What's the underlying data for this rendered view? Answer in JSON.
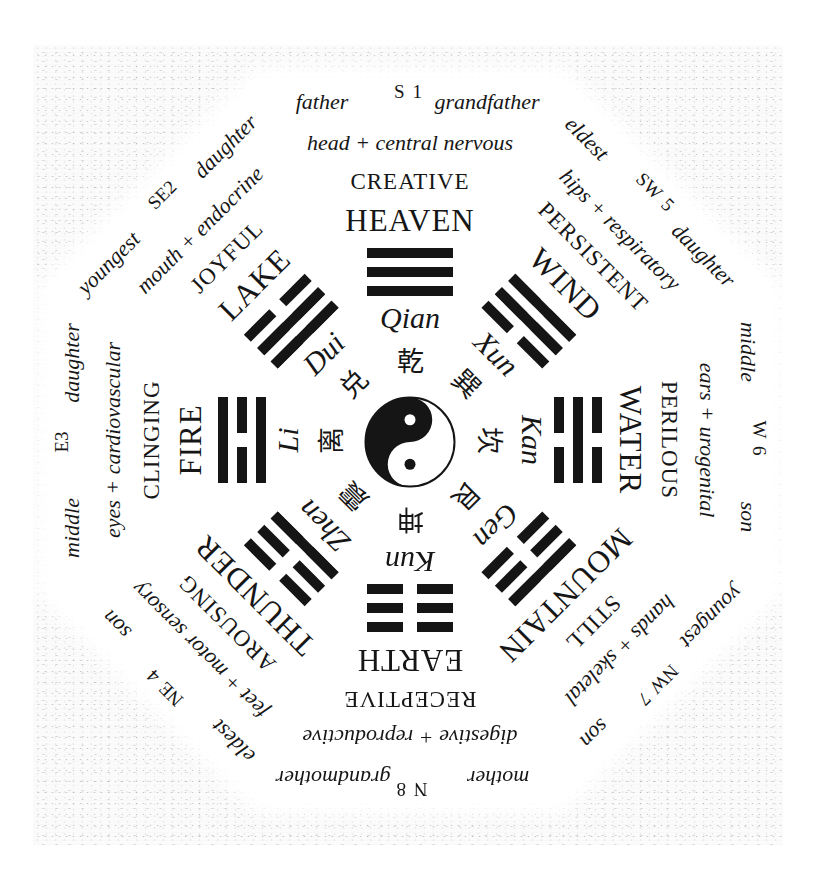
{
  "diagram": {
    "center": {
      "symbol": "yin-yang"
    },
    "colors": {
      "ink": "#161616",
      "paper": "#fbfbfb",
      "octagon": "#ffffff"
    },
    "sectors": [
      {
        "direction": "S 1",
        "relation_left": "father",
        "relation_right": "grandfather",
        "body": "head + central nervous",
        "quality": "CREATIVE",
        "element": "HEAVEN",
        "trigram": [
          1,
          1,
          1
        ],
        "name": "Qian",
        "char": "乾"
      },
      {
        "direction": "SW 5",
        "relation_left": "eldest",
        "relation_right": "daughter",
        "body": "hips + respiratory",
        "quality": "PERSISTENT",
        "element": "WIND",
        "trigram": [
          1,
          1,
          0
        ],
        "name": "Xun",
        "char": "巽"
      },
      {
        "direction": "W 6",
        "relation_left": "middle",
        "relation_right": "son",
        "body": "ears + urogenital",
        "quality": "PERILOUS",
        "element": "WATER",
        "trigram": [
          0,
          1,
          0
        ],
        "name": "Kan",
        "char": "坎"
      },
      {
        "direction": "NW 7",
        "relation_left": "youngest",
        "relation_right": "son",
        "body": "hands + skeletal",
        "quality": "STILL",
        "element": "MOUNTAIN",
        "trigram": [
          1,
          0,
          0
        ],
        "name": "Gen",
        "char": "艮"
      },
      {
        "direction": "N 8",
        "relation_left": "mother",
        "relation_right": "grandmother",
        "body": "digestive + reproductive",
        "quality": "RECEPTIVE",
        "element": "EARTH",
        "trigram": [
          0,
          0,
          0
        ],
        "name": "Kun",
        "char": "坤"
      },
      {
        "direction": "NE 4",
        "relation_left": "eldest",
        "relation_right": "son",
        "body": "feet + motor sensory",
        "quality": "AROUSING",
        "element": "THUNDER",
        "trigram": [
          0,
          0,
          1
        ],
        "name": "Zhen",
        "char": "震"
      },
      {
        "direction": "E3",
        "relation_left": "middle",
        "relation_right": "daughter",
        "body": "eyes + cardiovascular",
        "quality": "CLINGING",
        "element": "FIRE",
        "trigram": [
          1,
          0,
          1
        ],
        "name": "Li",
        "char": "离"
      },
      {
        "direction": "SE2",
        "relation_left": "youngest",
        "relation_right": "daughter",
        "body": "mouth + endocrine",
        "quality": "JOYFUL",
        "element": "LAKE",
        "trigram": [
          0,
          1,
          1
        ],
        "name": "Dui",
        "char": "兑"
      }
    ]
  }
}
